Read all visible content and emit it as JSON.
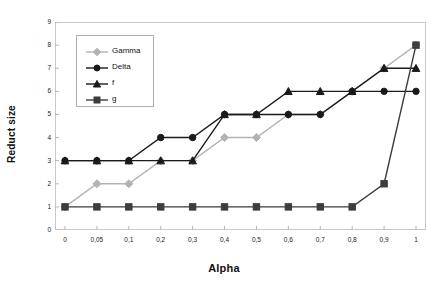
{
  "chart_data": {
    "type": "line",
    "title": "",
    "xlabel": "Alpha",
    "ylabel": "Reduct size",
    "categories": [
      "0",
      "0,05",
      "0,1",
      "0,2",
      "0,3",
      "0,4",
      "0,5",
      "0,6",
      "0,7",
      "0,8",
      "0,9",
      "1"
    ],
    "yticks": [
      "0",
      "1",
      "2",
      "3",
      "4",
      "5",
      "6",
      "7",
      "8",
      "9"
    ],
    "ylim": [
      0,
      9
    ],
    "grid": false,
    "legend_position": "inside-top-left",
    "series": [
      {
        "name": "Gamma",
        "color": "#b3b3b3",
        "marker": "diamond",
        "values": [
          1,
          2,
          2,
          3,
          3,
          4,
          4,
          5,
          5,
          6,
          7,
          8
        ]
      },
      {
        "name": "Delta",
        "color": "#1a1a1a",
        "marker": "circle",
        "values": [
          3,
          3,
          3,
          4,
          4,
          5,
          5,
          5,
          5,
          6,
          6,
          6
        ]
      },
      {
        "name": "f",
        "color": "#1a1a1a",
        "marker": "triangle",
        "values": [
          3,
          3,
          3,
          3,
          3,
          5,
          5,
          6,
          6,
          6,
          7,
          7
        ]
      },
      {
        "name": "g",
        "color": "#3d3d3d",
        "marker": "square",
        "values": [
          1,
          1,
          1,
          1,
          1,
          1,
          1,
          1,
          1,
          1,
          2,
          8
        ]
      }
    ]
  },
  "axis": {
    "x_title": "Alpha",
    "y_title": "Reduct size"
  },
  "colors": {
    "frame": "#c9c9c9",
    "legend_border": "#b0b0b0",
    "background": "#ffffff"
  }
}
